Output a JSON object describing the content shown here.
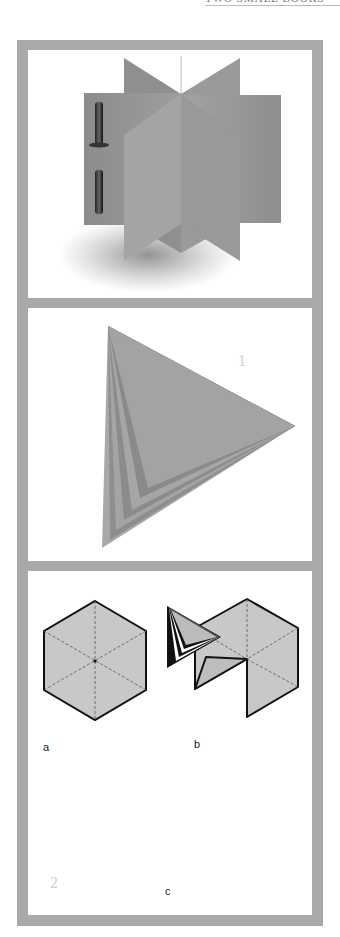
{
  "header": {
    "text": "TWO SMALL BOOKS"
  },
  "panels": [
    {
      "id": "panel-1",
      "description": "3D illustration of a book with folded gray pages and a binding post"
    },
    {
      "id": "panel-2",
      "description": "Stacked folded triangular pages",
      "marker": "1"
    },
    {
      "id": "panel-3",
      "description": "Hexagon folding steps",
      "labels": {
        "a": "a",
        "b": "b",
        "c": "c"
      },
      "marker": "2"
    }
  ],
  "colors": {
    "frame": "#a9a9a9",
    "page": "#9a9a9a",
    "hex_fill": "#c8c8c8",
    "outline": "#111111"
  }
}
